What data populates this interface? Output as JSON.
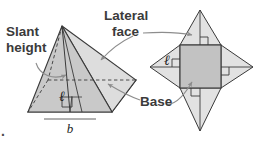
{
  "figure": {
    "background_color": "#ffffff",
    "stroke_color": "#3a3a3a",
    "leader_color": "#8d8d8d",
    "fill_base": "#c9c9c9",
    "fill_face_light": "#e4e4e4",
    "fill_face_mid": "#d3d3d3",
    "corner_mark": "."
  },
  "labels": {
    "slant_height_line1": "Slant",
    "slant_height_line2": "height",
    "lateral_face_line1": "Lateral",
    "lateral_face_line2": "face",
    "base": "Base"
  },
  "variables": {
    "slant_height_symbol": "ℓ",
    "base_symbol": "b"
  },
  "solid_pyramid": {
    "name": "square-pyramid-solid",
    "apex": [
      62,
      26
    ],
    "base_front_left": [
      28,
      112
    ],
    "base_front_right": [
      112,
      112
    ],
    "base_back_right": [
      136,
      80
    ],
    "base_back_left": [
      48,
      80
    ],
    "has_hidden_edges": true,
    "has_right_angle_marks": true,
    "slant_height_label": "ℓ",
    "base_edge_label": "b"
  },
  "net_pyramid": {
    "name": "square-pyramid-net",
    "square": {
      "x": 180,
      "y": 45,
      "width": 41,
      "height": 43
    },
    "apex_top": [
      200,
      10
    ],
    "apex_bottom": [
      200,
      131
    ],
    "apex_left": [
      150,
      67
    ],
    "apex_right": [
      253,
      67
    ],
    "right_angle_marks": 4,
    "slant_height_label": "ℓ"
  },
  "leaders": [
    {
      "name": "slant-height-leader",
      "from_label": "Slant height",
      "to_target": "pyramid-slant-height"
    },
    {
      "name": "lateral-face-leader-solid",
      "from_label": "Lateral face",
      "to_target": "pyramid-lateral-face"
    },
    {
      "name": "lateral-face-leader-net",
      "from_label": "Lateral face",
      "to_target": "net-lateral-face"
    },
    {
      "name": "base-leader-solid",
      "from_label": "Base",
      "to_target": "pyramid-base"
    },
    {
      "name": "base-leader-net",
      "from_label": "Base",
      "to_target": "net-base-square"
    }
  ]
}
